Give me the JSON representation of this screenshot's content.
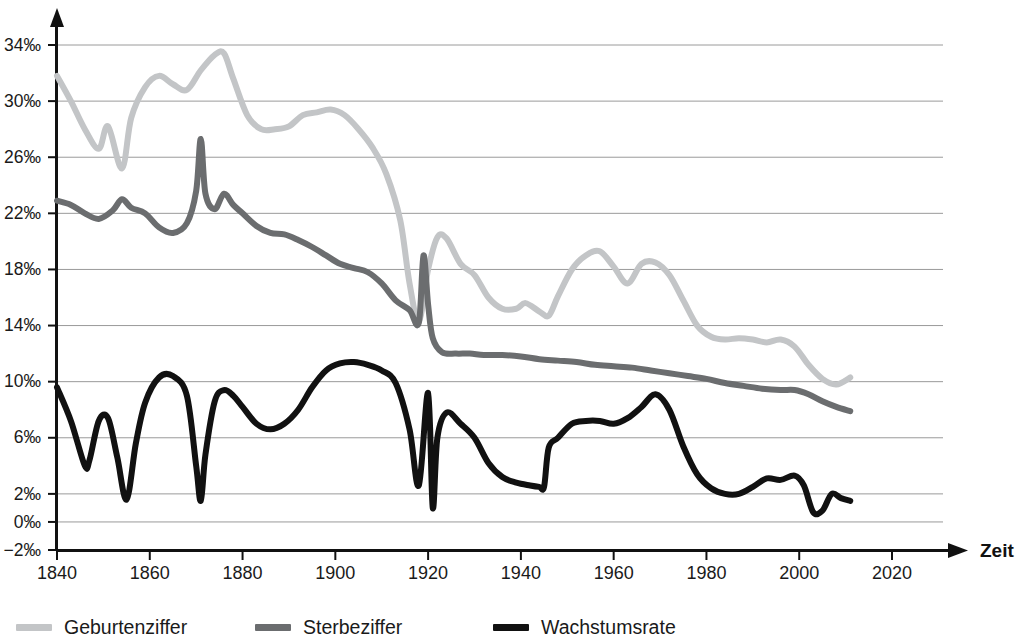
{
  "chart_data": {
    "type": "line",
    "title": "",
    "subtitle": "",
    "xlabel": "Zeit",
    "ylabel": "",
    "xlim": [
      1840,
      2028
    ],
    "ylim": [
      -2,
      35.6
    ],
    "grid": true,
    "legend_position": "bottom",
    "x_ticks": [
      1840,
      1860,
      1880,
      1900,
      1920,
      1940,
      1960,
      1980,
      2000,
      2020
    ],
    "x_tick_labels": [
      "1840",
      "1860",
      "1880",
      "1900",
      "1920",
      "1940",
      "1960",
      "1980",
      "2000",
      "2020"
    ],
    "y_ticks": [
      34,
      30,
      26,
      22,
      18,
      14,
      10,
      6,
      2,
      0,
      -2
    ],
    "y_tick_labels": [
      "34‰",
      "30‰",
      "26‰",
      "22‰",
      "18‰",
      "14‰",
      "10‰",
      "6‰",
      "2‰",
      "0‰",
      "−2‰"
    ],
    "unit": "‰",
    "series": [
      {
        "name": "Geburtenziffer",
        "color": "#c3c5c7",
        "x": [
          1840,
          1843,
          1846,
          1849,
          1851,
          1854,
          1856,
          1859,
          1862,
          1865,
          1868,
          1871,
          1874,
          1876,
          1878,
          1881,
          1884,
          1887,
          1890,
          1893,
          1896,
          1899,
          1902,
          1905,
          1908,
          1911,
          1914,
          1916,
          1918,
          1920,
          1922,
          1924,
          1927,
          1930,
          1933,
          1936,
          1939,
          1941,
          1944,
          1946,
          1948,
          1951,
          1954,
          1957,
          1960,
          1963,
          1966,
          1969,
          1972,
          1975,
          1978,
          1981,
          1984,
          1987,
          1990,
          1993,
          1996,
          1999,
          2002,
          2005,
          2008,
          2011
        ],
        "y": [
          31.8,
          30.0,
          28.0,
          26.6,
          28.2,
          25.2,
          28.8,
          31.0,
          31.8,
          31.2,
          30.8,
          32.2,
          33.3,
          33.4,
          31.6,
          29.0,
          28.0,
          28.0,
          28.2,
          29.0,
          29.2,
          29.4,
          29.0,
          28.0,
          26.7,
          24.8,
          21.5,
          17.0,
          14.3,
          18.0,
          20.3,
          20.2,
          18.4,
          17.6,
          16.0,
          15.2,
          15.2,
          15.6,
          15.0,
          14.7,
          16.1,
          18.0,
          19.0,
          19.3,
          18.2,
          17.0,
          18.4,
          18.5,
          17.6,
          15.8,
          14.0,
          13.2,
          13.0,
          13.1,
          13.0,
          12.8,
          13.0,
          12.5,
          11.2,
          10.2,
          9.8,
          10.3
        ]
      },
      {
        "name": "Sterbeziffer",
        "color": "#6b6d6f",
        "x": [
          1840,
          1843,
          1846,
          1849,
          1852,
          1854,
          1856,
          1859,
          1862,
          1865,
          1868,
          1870,
          1871,
          1872,
          1874,
          1876,
          1878,
          1880,
          1883,
          1886,
          1889,
          1892,
          1895,
          1898,
          1901,
          1904,
          1907,
          1910,
          1913,
          1916,
          1918,
          1919,
          1920,
          1921,
          1923,
          1926,
          1929,
          1932,
          1936,
          1940,
          1944,
          1948,
          1952,
          1956,
          1960,
          1964,
          1968,
          1972,
          1976,
          1980,
          1984,
          1988,
          1992,
          1996,
          1999,
          2002,
          2005,
          2008,
          2011
        ],
        "y": [
          22.9,
          22.6,
          22.0,
          21.6,
          22.2,
          23.0,
          22.4,
          22.0,
          21.0,
          20.6,
          21.3,
          23.6,
          27.3,
          23.4,
          22.3,
          23.4,
          22.6,
          22.0,
          21.1,
          20.6,
          20.5,
          20.1,
          19.6,
          19.0,
          18.4,
          18.1,
          17.8,
          17.0,
          15.8,
          15.1,
          14.2,
          19.0,
          15.5,
          13.1,
          12.1,
          12.0,
          12.0,
          11.9,
          11.9,
          11.8,
          11.6,
          11.5,
          11.4,
          11.2,
          11.1,
          11.0,
          10.8,
          10.6,
          10.4,
          10.2,
          9.9,
          9.7,
          9.5,
          9.4,
          9.4,
          9.1,
          8.6,
          8.2,
          7.9
        ]
      },
      {
        "name": "Wachstumsrate",
        "color": "#111111",
        "x": [
          1840,
          1843,
          1846,
          1847,
          1849,
          1851,
          1853,
          1855,
          1857,
          1859,
          1862,
          1865,
          1868,
          1870,
          1871,
          1872,
          1874,
          1876,
          1878,
          1880,
          1883,
          1886,
          1889,
          1892,
          1895,
          1898,
          1901,
          1904,
          1907,
          1910,
          1913,
          1916,
          1918,
          1920,
          1921,
          1922,
          1924,
          1927,
          1930,
          1933,
          1936,
          1939,
          1942,
          1944,
          1945,
          1946,
          1948,
          1951,
          1954,
          1957,
          1960,
          1963,
          1966,
          1969,
          1972,
          1975,
          1978,
          1981,
          1984,
          1987,
          1990,
          1993,
          1996,
          1999,
          2001,
          2003,
          2005,
          2007,
          2009,
          2011
        ],
        "y": [
          9.6,
          7.2,
          4.0,
          4.4,
          7.2,
          7.4,
          4.6,
          1.6,
          5.6,
          8.5,
          10.3,
          10.4,
          9.0,
          4.0,
          1.5,
          4.8,
          8.6,
          9.4,
          9.0,
          8.2,
          7.0,
          6.6,
          7.0,
          8.0,
          9.6,
          10.8,
          11.3,
          11.4,
          11.2,
          10.8,
          9.9,
          6.6,
          2.6,
          9.2,
          1.0,
          6.0,
          7.8,
          7.0,
          6.0,
          4.2,
          3.2,
          2.8,
          2.6,
          2.5,
          2.5,
          5.3,
          6.0,
          7.0,
          7.2,
          7.2,
          7.0,
          7.4,
          8.2,
          9.1,
          8.0,
          5.4,
          3.4,
          2.4,
          2.0,
          2.0,
          2.5,
          3.1,
          3.0,
          3.3,
          2.6,
          0.7,
          0.8,
          2.0,
          1.7,
          1.5
        ]
      }
    ]
  },
  "legend": {
    "items": [
      {
        "label": "Geburtenziffer",
        "color": "#c3c5c7"
      },
      {
        "label": "Sterbeziffer",
        "color": "#6b6d6f"
      },
      {
        "label": "Wachstumsrate",
        "color": "#111111"
      }
    ]
  },
  "axes": {
    "x_title": "Zeit",
    "gridline_color": "#9a9a9a",
    "axis_color": "#111111"
  }
}
